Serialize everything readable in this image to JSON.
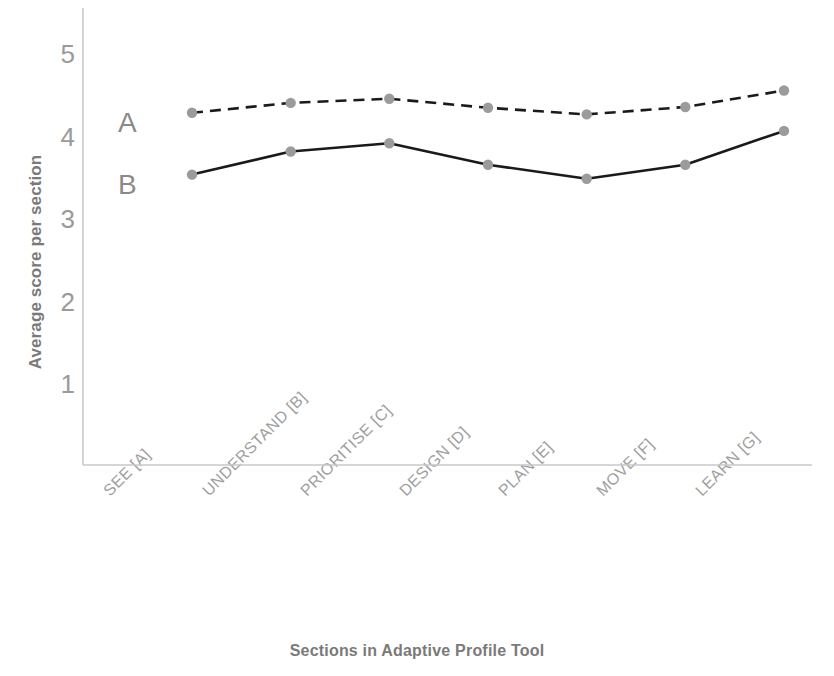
{
  "chart_data": {
    "type": "line",
    "title": "",
    "xlabel": "Sections in Adaptive Profile Tool",
    "ylabel": "Average score per section",
    "categories": [
      "SEE [A]",
      "UNDERSTAND [B]",
      "PRIORITISE [C]",
      "DESIGN [D]",
      "PLAN [E]",
      "MOVE [F]",
      "LEARN [G]"
    ],
    "yticks": [
      1,
      2,
      3,
      4,
      5
    ],
    "ylim": [
      0,
      5.4
    ],
    "grid": false,
    "legend_position": "inline-left",
    "series": [
      {
        "name": "A",
        "style": "dashed",
        "color": "#1a1a1a",
        "marker_color": "#9b9b9b",
        "values": [
          4.3,
          4.42,
          4.47,
          4.36,
          4.28,
          4.37,
          4.57
        ]
      },
      {
        "name": "B",
        "style": "solid",
        "color": "#1a1a1a",
        "marker_color": "#9b9b9b",
        "values": [
          3.55,
          3.83,
          3.93,
          3.67,
          3.5,
          3.67,
          4.08
        ]
      }
    ]
  },
  "axes": {
    "y_tick_labels": [
      "5",
      "4",
      "3",
      "2",
      "1"
    ],
    "axis_color": "#c8c8c8"
  },
  "labels": {
    "series_a": "A",
    "series_b": "B"
  }
}
